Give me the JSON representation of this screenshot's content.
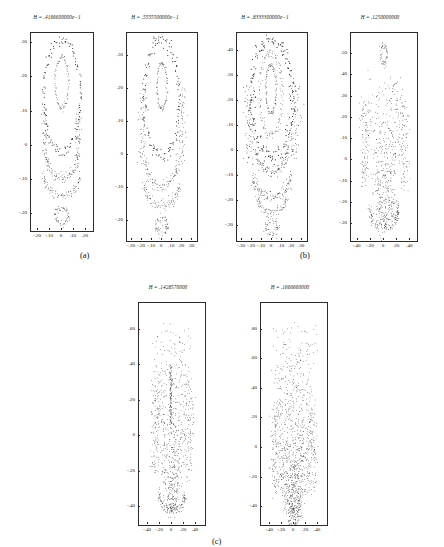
{
  "figure": {
    "caption_groups": [
      {
        "id": "a",
        "label": "(a)"
      },
      {
        "id": "b",
        "label": "(b)"
      },
      {
        "id": "c",
        "label": "(c)"
      }
    ],
    "background_color": "#ffffff",
    "point_color": "#111111",
    "axis_color": "#2b2b2b"
  },
  "chart_data": [
    {
      "id": "panel-1",
      "type": "scatter",
      "title": "H = .4166600000e−1",
      "group": "a",
      "xlabel": "",
      "ylabel": "",
      "xlim": [
        -0.26,
        0.26
      ],
      "ylim": [
        -0.25,
        0.33
      ],
      "grid": false,
      "legend": "none",
      "xticks": [
        "-.20",
        "-.10",
        "0",
        ".10",
        ".20"
      ],
      "xtickvals": [
        -0.2,
        -0.1,
        0,
        0.1,
        0.2
      ],
      "yticks": [
        ".30",
        ".20",
        ".10",
        "0",
        "-.10",
        "-.20"
      ],
      "ytickvals": [
        0.3,
        0.2,
        0.1,
        0,
        -0.1,
        -0.2
      ],
      "structures": [
        {
          "kind": "closed-curve",
          "cx": 0.0,
          "cy": 0.185,
          "rx": 0.055,
          "ry": 0.075,
          "n": 90,
          "jitter": 0.004,
          "thick": 0.006
        },
        {
          "kind": "closed-curve",
          "cx": 0.0,
          "cy": 0.145,
          "rx": 0.155,
          "ry": 0.165,
          "n": 130,
          "jitter": 0.009,
          "thick": 0.01
        },
        {
          "kind": "arc-lower",
          "cx": 0.0,
          "cy": -0.02,
          "rx": 0.135,
          "ry": 0.075,
          "n": 95,
          "jitter": 0.008,
          "thick": 0.008
        },
        {
          "kind": "arc-lower",
          "cx": 0.0,
          "cy": -0.085,
          "rx": 0.15,
          "ry": 0.062,
          "n": 90,
          "jitter": 0.007,
          "thick": 0.007
        },
        {
          "kind": "blob",
          "cx": 0.0,
          "cy": -0.205,
          "rx": 0.055,
          "ry": 0.022,
          "n": 60,
          "jitter": 0.006,
          "thick": 0.008
        },
        {
          "kind": "vstrand",
          "cx": -0.14,
          "cy": 0.04,
          "rx": 0.018,
          "ry": 0.07,
          "n": 45,
          "jitter": 0.01,
          "thick": 0.008
        },
        {
          "kind": "vstrand",
          "cx": 0.14,
          "cy": 0.04,
          "rx": 0.018,
          "ry": 0.07,
          "n": 45,
          "jitter": 0.01,
          "thick": 0.008
        }
      ],
      "density": 520
    },
    {
      "id": "panel-2",
      "type": "scatter",
      "title": "H = .5555500000e−1",
      "group": "a",
      "xlabel": "",
      "ylabel": "",
      "xlim": [
        -0.35,
        0.35
      ],
      "ylim": [
        -0.26,
        0.37
      ],
      "grid": false,
      "legend": "none",
      "xticks": [
        "-.30",
        "-.20",
        "-.10",
        "0",
        ".10",
        ".20",
        ".30"
      ],
      "xtickvals": [
        -0.3,
        -0.2,
        -0.1,
        0,
        0.1,
        0.2,
        0.3
      ],
      "yticks": [
        ".30",
        ".20",
        ".10",
        "0",
        "-.10",
        "-.20"
      ],
      "ytickvals": [
        0.3,
        0.2,
        0.1,
        0,
        -0.1,
        -0.2
      ],
      "structures": [
        {
          "kind": "closed-curve",
          "cx": 0.0,
          "cy": 0.21,
          "rx": 0.05,
          "ry": 0.068,
          "n": 95,
          "jitter": 0.005,
          "thick": 0.007
        },
        {
          "kind": "closed-curve",
          "cx": 0.0,
          "cy": 0.175,
          "rx": 0.175,
          "ry": 0.175,
          "n": 140,
          "jitter": 0.012,
          "thick": 0.012
        },
        {
          "kind": "arc-lower",
          "cx": 0.0,
          "cy": -0.01,
          "rx": 0.16,
          "ry": 0.085,
          "n": 100,
          "jitter": 0.01,
          "thick": 0.009
        },
        {
          "kind": "arc-lower",
          "cx": 0.0,
          "cy": -0.085,
          "rx": 0.175,
          "ry": 0.068,
          "n": 95,
          "jitter": 0.009,
          "thick": 0.008
        },
        {
          "kind": "blob",
          "cx": 0.0,
          "cy": -0.215,
          "rx": 0.058,
          "ry": 0.024,
          "n": 65,
          "jitter": 0.007,
          "thick": 0.009
        },
        {
          "kind": "vstrand",
          "cx": -0.2,
          "cy": 0.09,
          "rx": 0.03,
          "ry": 0.115,
          "n": 70,
          "jitter": 0.014,
          "thick": 0.009
        },
        {
          "kind": "vstrand",
          "cx": 0.2,
          "cy": 0.09,
          "rx": 0.03,
          "ry": 0.115,
          "n": 70,
          "jitter": 0.014,
          "thick": 0.009
        }
      ],
      "density": 600
    },
    {
      "id": "panel-3",
      "type": "scatter",
      "title": "H = .8333300000e−1",
      "group": "b",
      "xlabel": "",
      "ylabel": "",
      "xlim": [
        -0.35,
        0.35
      ],
      "ylim": [
        -0.36,
        0.47
      ],
      "grid": false,
      "legend": "none",
      "xticks": [
        "-.30",
        "-.20",
        "-.10",
        "0",
        ".10",
        ".20",
        ".30"
      ],
      "xtickvals": [
        -0.3,
        -0.2,
        -0.1,
        0,
        0.1,
        0.2,
        0.3
      ],
      "yticks": [
        ".40",
        ".30",
        ".20",
        ".10",
        "0",
        "-.10",
        "-.20",
        "-.30"
      ],
      "ytickvals": [
        0.4,
        0.3,
        0.2,
        0.1,
        0,
        -0.1,
        -0.2,
        -0.3
      ],
      "structures": [
        {
          "kind": "closed-curve",
          "cx": -0.01,
          "cy": 0.245,
          "rx": 0.052,
          "ry": 0.095,
          "n": 105,
          "jitter": 0.006,
          "thick": 0.008
        },
        {
          "kind": "closed-curve",
          "cx": -0.01,
          "cy": 0.225,
          "rx": 0.115,
          "ry": 0.165,
          "n": 130,
          "jitter": 0.01,
          "thick": 0.009
        },
        {
          "kind": "closed-curve",
          "cx": 0.0,
          "cy": 0.21,
          "rx": 0.205,
          "ry": 0.235,
          "n": 160,
          "jitter": 0.016,
          "thick": 0.013
        },
        {
          "kind": "arc-lower",
          "cx": 0.0,
          "cy": 0.01,
          "rx": 0.155,
          "ry": 0.095,
          "n": 105,
          "jitter": 0.011,
          "thick": 0.01
        },
        {
          "kind": "arc-lower",
          "cx": 0.0,
          "cy": -0.1,
          "rx": 0.185,
          "ry": 0.085,
          "n": 110,
          "jitter": 0.012,
          "thick": 0.01
        },
        {
          "kind": "arc-lower",
          "cx": 0.0,
          "cy": -0.185,
          "rx": 0.145,
          "ry": 0.06,
          "n": 80,
          "jitter": 0.01,
          "thick": 0.009
        },
        {
          "kind": "blob",
          "cx": 0.0,
          "cy": -0.305,
          "rx": 0.06,
          "ry": 0.026,
          "n": 60,
          "jitter": 0.008,
          "thick": 0.009
        },
        {
          "kind": "vstrand",
          "cx": -0.225,
          "cy": 0.12,
          "rx": 0.035,
          "ry": 0.155,
          "n": 85,
          "jitter": 0.018,
          "thick": 0.01
        },
        {
          "kind": "vstrand",
          "cx": 0.225,
          "cy": 0.12,
          "rx": 0.035,
          "ry": 0.155,
          "n": 85,
          "jitter": 0.018,
          "thick": 0.01
        }
      ],
      "density": 760
    },
    {
      "id": "panel-4",
      "type": "scatter",
      "title": "H = .1250000000",
      "group": "b",
      "xlabel": "",
      "ylabel": "",
      "xlim": [
        -0.5,
        0.5
      ],
      "ylim": [
        -0.38,
        0.6
      ],
      "grid": false,
      "legend": "none",
      "xticks": [
        "-.40",
        "-.20",
        "0",
        ".20",
        ".40"
      ],
      "xtickvals": [
        -0.4,
        -0.2,
        0,
        0.2,
        0.4
      ],
      "yticks": [
        ".50",
        ".40",
        ".30",
        ".20",
        ".10",
        "0",
        "-.10",
        "-.20",
        "-.30"
      ],
      "ytickvals": [
        0.5,
        0.4,
        0.3,
        0.2,
        0.1,
        0,
        -0.1,
        -0.2,
        -0.3
      ],
      "structures": [
        {
          "kind": "closed-curve",
          "cx": 0.0,
          "cy": 0.5,
          "rx": 0.045,
          "ry": 0.045,
          "n": 55,
          "jitter": 0.01,
          "thick": 0.01
        },
        {
          "kind": "chaos-wedge",
          "cx": 0.0,
          "cy": 0.05,
          "rx": 0.3,
          "ry": 0.36,
          "n": 420,
          "jitter": 0.03,
          "thick": 0.01
        },
        {
          "kind": "arc-lower",
          "cx": 0.0,
          "cy": -0.24,
          "rx": 0.215,
          "ry": 0.075,
          "n": 110,
          "jitter": 0.016,
          "thick": 0.01
        },
        {
          "kind": "vstrand",
          "cx": -0.3,
          "cy": 0.08,
          "rx": 0.05,
          "ry": 0.2,
          "n": 100,
          "jitter": 0.026,
          "thick": 0.011
        },
        {
          "kind": "vstrand",
          "cx": 0.3,
          "cy": 0.08,
          "rx": 0.05,
          "ry": 0.2,
          "n": 100,
          "jitter": 0.026,
          "thick": 0.011
        },
        {
          "kind": "closed-curve",
          "cx": 0.17,
          "cy": -0.23,
          "rx": 0.055,
          "ry": 0.035,
          "n": 45,
          "jitter": 0.01,
          "thick": 0.01
        }
      ],
      "density": 900
    },
    {
      "id": "panel-5",
      "type": "scatter",
      "title": "H = .1428570000",
      "group": "c",
      "xlabel": "",
      "ylabel": "",
      "xlim": [
        -0.55,
        0.55
      ],
      "ylim": [
        -0.5,
        0.75
      ],
      "grid": false,
      "legend": "none",
      "xticks": [
        "-.40",
        "-.20",
        "0",
        ".20",
        ".40"
      ],
      "xtickvals": [
        -0.4,
        -0.2,
        0,
        0.2,
        0.4
      ],
      "yticks": [
        ".60",
        ".40",
        ".20",
        "0",
        "-.20",
        "-.40"
      ],
      "ytickvals": [
        0.6,
        0.4,
        0.2,
        0,
        -0.2,
        -0.4
      ],
      "structures": [
        {
          "kind": "chaos-wedge",
          "cx": 0.0,
          "cy": 0.1,
          "rx": 0.33,
          "ry": 0.52,
          "n": 560,
          "jitter": 0.035,
          "thick": 0.011
        },
        {
          "kind": "vbar",
          "cx": -0.02,
          "cy": 0.23,
          "rx": 0.022,
          "ry": 0.17,
          "n": 110,
          "jitter": 0.008,
          "thick": 0.011
        },
        {
          "kind": "arc-lower",
          "cx": 0.0,
          "cy": -0.33,
          "rx": 0.215,
          "ry": 0.085,
          "n": 110,
          "jitter": 0.016,
          "thick": 0.01
        },
        {
          "kind": "vstrand",
          "cx": -0.28,
          "cy": 0.05,
          "rx": 0.055,
          "ry": 0.26,
          "n": 110,
          "jitter": 0.03,
          "thick": 0.011
        },
        {
          "kind": "vstrand",
          "cx": 0.28,
          "cy": 0.05,
          "rx": 0.055,
          "ry": 0.26,
          "n": 110,
          "jitter": 0.03,
          "thick": 0.011
        }
      ],
      "density": 1000
    },
    {
      "id": "panel-6",
      "type": "scatter",
      "title": "H = .1666660000",
      "group": "c",
      "xlabel": "",
      "ylabel": "",
      "xlim": [
        -0.55,
        0.55
      ],
      "ylim": [
        -0.52,
        0.98
      ],
      "grid": false,
      "legend": "none",
      "xticks": [
        "-.40",
        "-.20",
        "0",
        ".20",
        ".40"
      ],
      "xtickvals": [
        -0.4,
        -0.2,
        0,
        0.2,
        0.4
      ],
      "yticks": [
        ".80",
        ".60",
        ".40",
        ".20",
        "0",
        "-.20",
        "-.40"
      ],
      "ytickvals": [
        0.8,
        0.6,
        0.4,
        0.2,
        0,
        -0.2,
        -0.4
      ],
      "structures": [
        {
          "kind": "chaos-wedge",
          "cx": 0.0,
          "cy": 0.12,
          "rx": 0.36,
          "ry": 0.72,
          "n": 720,
          "jitter": 0.04,
          "thick": 0.011
        },
        {
          "kind": "chaos-wedge",
          "cx": 0.0,
          "cy": -0.2,
          "rx": 0.34,
          "ry": 0.28,
          "n": 260,
          "jitter": 0.04,
          "thick": 0.011
        },
        {
          "kind": "vstrand",
          "cx": -0.3,
          "cy": 0.0,
          "rx": 0.06,
          "ry": 0.3,
          "n": 120,
          "jitter": 0.032,
          "thick": 0.011
        },
        {
          "kind": "vstrand",
          "cx": 0.3,
          "cy": 0.0,
          "rx": 0.06,
          "ry": 0.3,
          "n": 120,
          "jitter": 0.032,
          "thick": 0.011
        }
      ],
      "density": 1150
    }
  ],
  "layout": {
    "panels": [
      {
        "id": "panel-1",
        "left": 16,
        "top": 14,
        "width": 82,
        "height": 232,
        "plot_left": 14,
        "plot_top": 18,
        "plot_width": 62,
        "plot_height": 198
      },
      {
        "id": "panel-2",
        "left": 108,
        "top": 14,
        "width": 94,
        "height": 232,
        "plot_left": 18,
        "plot_top": 18,
        "plot_width": 70,
        "plot_height": 208
      },
      {
        "id": "panel-3",
        "left": 218,
        "top": 14,
        "width": 94,
        "height": 232,
        "plot_left": 18,
        "plot_top": 18,
        "plot_width": 70,
        "plot_height": 208
      },
      {
        "id": "panel-4",
        "left": 330,
        "top": 14,
        "width": 100,
        "height": 232,
        "plot_left": 20,
        "plot_top": 18,
        "plot_width": 66,
        "plot_height": 208
      },
      {
        "id": "panel-5",
        "left": 118,
        "top": 284,
        "width": 100,
        "height": 250,
        "plot_left": 20,
        "plot_top": 18,
        "plot_width": 66,
        "plot_height": 222
      },
      {
        "id": "panel-6",
        "left": 240,
        "top": 284,
        "width": 100,
        "height": 250,
        "plot_left": 20,
        "plot_top": 18,
        "plot_width": 66,
        "plot_height": 222
      }
    ],
    "group_labels": [
      {
        "id": "a",
        "left": 80,
        "top": 250
      },
      {
        "id": "b",
        "left": 300,
        "top": 250
      },
      {
        "id": "c",
        "left": 212,
        "top": 536
      }
    ]
  }
}
